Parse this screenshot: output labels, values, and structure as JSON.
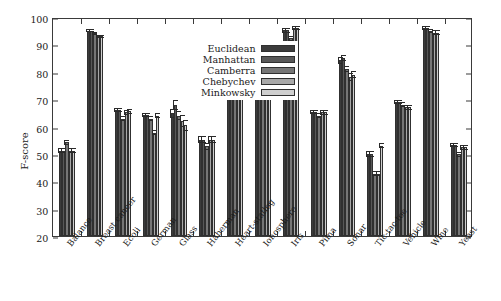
{
  "chart_data": {
    "type": "bar",
    "title": "",
    "xlabel": "",
    "ylabel": "F-score",
    "ylim": [
      20,
      100
    ],
    "yticks": [
      20,
      30,
      40,
      50,
      60,
      70,
      80,
      90,
      100
    ],
    "grid": false,
    "legend_position": "top-center-inside",
    "categories": [
      "Balance",
      "Breast cancer",
      "Ecoli",
      "German",
      "Glass",
      "Haberman",
      "Heart-statlog",
      "Ionosphere",
      "Iris",
      "Pima",
      "Sonar",
      "Tic-tac-toe",
      "Vehicle",
      "Wine",
      "Yeast"
    ],
    "series": [
      {
        "name": "Euclidean",
        "color": "#3b3b3b",
        "values": [
          51.2,
          95.0,
          66.0,
          64.2,
          64.8,
          55.2,
          75.0,
          86.0,
          95.2,
          65.2,
          84.2,
          50.0,
          69.0,
          96.0,
          53.2
        ],
        "errors": [
          0.8,
          0.5,
          0.8,
          0.8,
          1.6,
          1.3,
          1.2,
          0.8,
          0.9,
          0.8,
          1.2,
          1.0,
          0.7,
          0.8,
          0.8
        ]
      },
      {
        "name": "Manhattan",
        "color": "#585858",
        "values": [
          51.2,
          95.0,
          66.0,
          64.2,
          68.0,
          55.2,
          76.5,
          90.0,
          95.2,
          65.2,
          85.0,
          50.0,
          69.0,
          96.0,
          53.2
        ],
        "errors": [
          0.8,
          0.5,
          0.8,
          0.8,
          1.8,
          1.3,
          1.1,
          1.0,
          0.9,
          0.8,
          1.1,
          1.0,
          0.7,
          0.8,
          0.8
        ]
      },
      {
        "name": "Camberra",
        "color": "#767676",
        "values": [
          54.2,
          94.0,
          62.8,
          62.8,
          64.0,
          52.8,
          74.2,
          85.2,
          92.2,
          64.0,
          81.0,
          42.8,
          68.0,
          95.0,
          49.8
        ],
        "errors": [
          0.8,
          0.5,
          0.9,
          0.9,
          1.6,
          1.2,
          1.1,
          0.9,
          1.0,
          0.9,
          1.2,
          1.0,
          0.8,
          0.8,
          0.9
        ]
      },
      {
        "name": "Chebychev",
        "color": "#a8a8a8",
        "values": [
          51.2,
          93.0,
          65.2,
          57.8,
          62.0,
          55.2,
          71.0,
          87.0,
          96.0,
          65.2,
          78.2,
          42.8,
          67.0,
          94.2,
          52.5
        ],
        "errors": [
          0.8,
          0.6,
          0.9,
          1.0,
          2.2,
          1.3,
          1.3,
          1.0,
          0.8,
          0.9,
          1.4,
          1.0,
          0.8,
          0.9,
          0.9
        ]
      },
      {
        "name": "Minkowsky",
        "color": "#cfcfcf",
        "values": [
          51.2,
          93.0,
          65.5,
          64.0,
          60.5,
          55.2,
          73.2,
          86.5,
          96.0,
          65.2,
          79.0,
          53.0,
          67.0,
          94.2,
          52.5
        ],
        "errors": [
          0.8,
          0.6,
          0.9,
          0.9,
          2.0,
          1.3,
          1.2,
          0.9,
          0.8,
          0.9,
          1.3,
          1.0,
          0.8,
          0.9,
          0.9
        ]
      }
    ]
  }
}
